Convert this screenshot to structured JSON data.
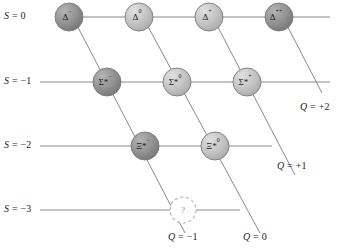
{
  "figure": {
    "background": "#ffffff",
    "line_color": "#8a8a8a",
    "node_dark_color": "#8e8e8e",
    "node_light_color": "#bdbdbd",
    "unknown_color": "#ffffff"
  },
  "axes": {
    "strangeness_labels": [
      {
        "name": "s-0",
        "text": "S = 0",
        "x": 4,
        "y": 10
      },
      {
        "name": "s-m1",
        "text": "S = −1",
        "x": 4,
        "y": 75
      },
      {
        "name": "s-m2",
        "text": "S = −2",
        "x": 4,
        "y": 139
      },
      {
        "name": "s-m3",
        "text": "S = −3",
        "x": 4,
        "y": 203
      }
    ],
    "charge_labels": [
      {
        "name": "q-plus2",
        "text": "Q = +2",
        "x": 300,
        "y": 101
      },
      {
        "name": "q-plus1",
        "text": "Q = +1",
        "x": 277,
        "y": 160
      },
      {
        "name": "q-minus1",
        "text": "Q = −1",
        "x": 168,
        "y": 231
      },
      {
        "name": "q-zero",
        "text": "Q = 0",
        "x": 243,
        "y": 231
      }
    ],
    "horizontal_lines": [
      {
        "name": "row-line-s0",
        "y": 17,
        "x1": 57,
        "x2": 330
      },
      {
        "name": "row-line-s-1",
        "y": 82,
        "x1": 40,
        "x2": 330
      },
      {
        "name": "row-line-s-2",
        "y": 146,
        "x1": 40,
        "x2": 272
      },
      {
        "name": "row-line-s-3",
        "y": 210,
        "x1": 40,
        "x2": 240
      }
    ],
    "diagonal_lines": [
      {
        "name": "diag-q-minus1",
        "x1": 69,
        "y1": 10,
        "x2": 185,
        "y2": 233
      },
      {
        "name": "diag-q-zero",
        "x1": 139,
        "y1": 10,
        "x2": 260,
        "y2": 233
      },
      {
        "name": "diag-q-plus1",
        "x1": 209,
        "y1": 10,
        "x2": 295,
        "y2": 175
      },
      {
        "name": "diag-q-plus2",
        "x1": 279,
        "y1": 10,
        "x2": 322,
        "y2": 93
      }
    ]
  },
  "chart_data": {
    "type": "scatter",
    "xlabel": "Q (electric charge)",
    "ylabel": "S (strangeness)",
    "grid": true,
    "legend": "none",
    "x": [
      -1,
      0,
      1,
      2,
      -1,
      0,
      1,
      -1,
      0,
      -1
    ],
    "y": [
      0,
      0,
      0,
      0,
      -1,
      -1,
      -1,
      -2,
      -2,
      -3
    ],
    "point_labels": [
      "Δ⁻",
      "Δ⁰",
      "Δ⁺",
      "Δ⁺⁺",
      "Σ*⁻",
      "Σ*⁰",
      "Σ*⁺",
      "Ξ*⁻",
      "Ξ*⁰",
      "?"
    ],
    "xlim": [
      -1.6,
      2.6
    ],
    "ylim": [
      -3.6,
      0.6
    ]
  },
  "nodes": [
    {
      "name": "node-delta-minus",
      "base": "Δ",
      "sup": "−",
      "cx": 69,
      "cy": 17,
      "r": 14,
      "shade": "dark",
      "strangeness": 0,
      "charge": -1
    },
    {
      "name": "node-delta-zero",
      "base": "Δ",
      "sup": "0",
      "cx": 139,
      "cy": 17,
      "r": 14,
      "shade": "light",
      "strangeness": 0,
      "charge": 0
    },
    {
      "name": "node-delta-plus",
      "base": "Δ",
      "sup": "+",
      "cx": 209,
      "cy": 17,
      "r": 14,
      "shade": "light",
      "strangeness": 0,
      "charge": 1
    },
    {
      "name": "node-delta-plusplus",
      "base": "Δ",
      "sup": "++",
      "cx": 279,
      "cy": 17,
      "r": 14,
      "shade": "dark",
      "strangeness": 0,
      "charge": 2
    },
    {
      "name": "node-sigma-star-minus",
      "base": "Σ*",
      "sup": "−",
      "cx": 107,
      "cy": 82,
      "r": 14,
      "shade": "dark",
      "strangeness": -1,
      "charge": -1
    },
    {
      "name": "node-sigma-star-zero",
      "base": "Σ*",
      "sup": "0",
      "cx": 177,
      "cy": 82,
      "r": 14,
      "shade": "light",
      "strangeness": -1,
      "charge": 0
    },
    {
      "name": "node-sigma-star-plus",
      "base": "Σ*",
      "sup": "+",
      "cx": 247,
      "cy": 82,
      "r": 14,
      "shade": "light",
      "strangeness": -1,
      "charge": 1
    },
    {
      "name": "node-xi-star-minus",
      "base": "Ξ*",
      "sup": "−",
      "cx": 145,
      "cy": 146,
      "r": 14,
      "shade": "dark",
      "strangeness": -2,
      "charge": -1
    },
    {
      "name": "node-xi-star-zero",
      "base": "Ξ*",
      "sup": "0",
      "cx": 215,
      "cy": 146,
      "r": 14,
      "shade": "light",
      "strangeness": -2,
      "charge": 0
    },
    {
      "name": "node-unknown-omega",
      "base": "?",
      "sup": "",
      "cx": 183,
      "cy": 210,
      "r": 13,
      "shade": "unknown",
      "strangeness": -3,
      "charge": -1
    }
  ]
}
